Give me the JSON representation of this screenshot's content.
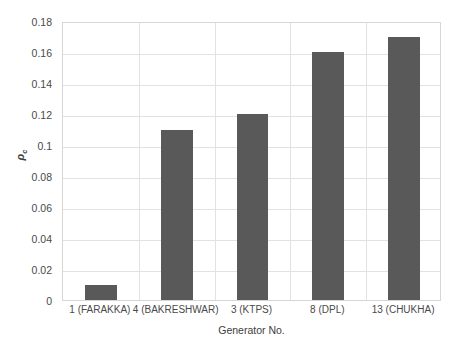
{
  "chart_data": {
    "type": "bar",
    "title": "",
    "xlabel": "Generator No.",
    "ylabel": "ρc",
    "ylabel_base": "ρ",
    "ylabel_sub": "c",
    "categories": [
      "1 (FARAKKA)",
      "4 (BAKRESHWAR)",
      "3 (KTPS)",
      "8 (DPL)",
      "13 (CHUKHA)"
    ],
    "values": [
      0.01,
      0.11,
      0.12,
      0.16,
      0.17
    ],
    "ylim": [
      0,
      0.18
    ],
    "ytick_labels": [
      "0",
      "0.02",
      "0.04",
      "0.06",
      "0.08",
      "0.1",
      "0.12",
      "0.14",
      "0.16",
      "0.18"
    ],
    "ytick_values": [
      0,
      0.02,
      0.04,
      0.06,
      0.08,
      0.1,
      0.12,
      0.14,
      0.16,
      0.18
    ],
    "grid": "both",
    "legend": "none",
    "bar_color": "#595959",
    "gridline_color": "#e2e2e2",
    "plot_border_color": "#d6d6d6",
    "background_color": "#ffffff"
  }
}
